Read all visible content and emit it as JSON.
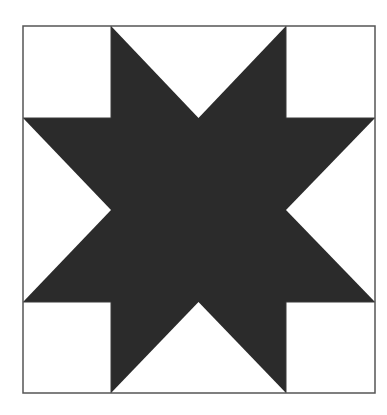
{
  "diagram": {
    "type": "quilt-block",
    "pattern": "eight-point-star",
    "grid": "3x3",
    "colors": {
      "background": "#ffffff",
      "star": "#2b2b2b",
      "border": "#555555",
      "grid_line": "#3a3a3a"
    },
    "frame": {
      "x": 23,
      "y": 26,
      "width": 352,
      "height": 367
    },
    "grid_lines_x": [
      111,
      286
    ],
    "grid_lines_y": [
      118,
      302
    ]
  }
}
